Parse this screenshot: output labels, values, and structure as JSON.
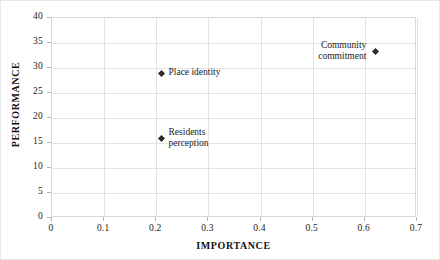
{
  "chart_data": {
    "type": "scatter",
    "title": "",
    "xlabel": "IMPORTANCE",
    "ylabel": "PERFORMANCE",
    "xlim": [
      0,
      0.7
    ],
    "ylim": [
      0,
      40
    ],
    "xticks": [
      "0",
      "0.1",
      "0.2",
      "0.3",
      "0.4",
      "0.5",
      "0.6",
      "0.7"
    ],
    "xtick_values": [
      0,
      0.1,
      0.2,
      0.3,
      0.4,
      0.5,
      0.6,
      0.7
    ],
    "yticks": [
      "0",
      "5",
      "10",
      "15",
      "20",
      "25",
      "30",
      "35",
      "40"
    ],
    "ytick_values": [
      0,
      5,
      10,
      15,
      20,
      25,
      30,
      35,
      40
    ],
    "grid": true,
    "legend": "none",
    "points": [
      {
        "label": "Place identity",
        "x": 0.21,
        "y": 29,
        "label_position": "right"
      },
      {
        "label": "Residents\nperception",
        "x": 0.21,
        "y": 16,
        "label_position": "right"
      },
      {
        "label": "Community\ncommitment",
        "x": 0.62,
        "y": 33.4,
        "label_position": "left"
      }
    ]
  }
}
